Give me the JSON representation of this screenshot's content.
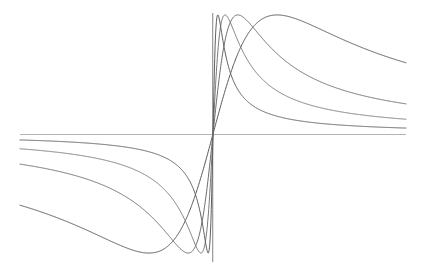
{
  "figure": {
    "title": "",
    "background_color": "#ffffff",
    "width": 423,
    "height": 274
  },
  "axes": {
    "origin_px": {
      "x": 213,
      "y": 134
    },
    "x_axis": {
      "name": "horizontal-axis",
      "color": "#b4b4b4",
      "stroke_width": 1.0,
      "x_start_px": 20,
      "x_end_px": 406,
      "y_px": 134
    },
    "y_axis": {
      "name": "vertical-axis",
      "color": "#8c8c8c",
      "stroke_width": 1.1,
      "y_start_px": 13,
      "y_end_px": 262,
      "x_px": 213
    }
  },
  "chart_data": {
    "type": "line",
    "title": "",
    "subtitle": "",
    "xlabel": "",
    "ylabel": "",
    "xlim": [
      -4.82,
      4.82
    ],
    "ylim": [
      -1.0,
      1.0
    ],
    "grid": false,
    "legend": "none",
    "symmetry": "odd (point symmetric about origin)",
    "function_family": "y = 2*a*x / (a^2 + x^2)",
    "x": [
      -4.8,
      -4.4,
      -4.0,
      -3.6,
      -3.2,
      -2.8,
      -2.4,
      -2.0,
      -1.6,
      -1.2,
      -0.8,
      -0.4,
      0.0,
      0.4,
      0.8,
      1.2,
      1.6,
      2.0,
      2.4,
      2.8,
      3.2,
      3.6,
      4.0,
      4.4,
      4.8
    ],
    "series": [
      {
        "name": "a = 1.60",
        "color": "#555555",
        "stroke_width": 1.0,
        "peak_xy": [
          1.6,
          1.0
        ],
        "trough_xy": [
          -1.6,
          -1.0
        ],
        "values": [
          -0.645,
          -0.69,
          -0.744,
          -0.806,
          -0.879,
          -0.963,
          -1.055,
          -1.139,
          -1.171,
          -1.071,
          -0.8,
          -0.427,
          0.0,
          0.427,
          0.8,
          1.071,
          1.171,
          1.139,
          1.055,
          0.963,
          0.879,
          0.806,
          0.744,
          0.69,
          0.645
        ]
      },
      {
        "name": "a = 0.62",
        "color": "#6b6b6b",
        "stroke_width": 1.0,
        "peak_xy": [
          0.62,
          0.72
        ],
        "trough_xy": [
          -0.62,
          -0.72
        ],
        "values": [
          -0.256,
          -0.279,
          -0.307,
          -0.341,
          -0.383,
          -0.437,
          -0.508,
          -0.601,
          -0.724,
          -0.876,
          -1.0,
          -0.93,
          0.0,
          0.93,
          1.0,
          0.876,
          0.724,
          0.601,
          0.508,
          0.437,
          0.383,
          0.341,
          0.307,
          0.279,
          0.256
        ]
      },
      {
        "name": "a = 0.30",
        "color": "#7a7a7a",
        "stroke_width": 1.0,
        "peak_xy": [
          0.3,
          0.47
        ],
        "trough_xy": [
          -0.3,
          -0.47
        ],
        "values": [
          -0.125,
          -0.136,
          -0.15,
          -0.167,
          -0.187,
          -0.214,
          -0.249,
          -0.296,
          -0.361,
          -0.451,
          -0.566,
          -0.68,
          0.0,
          0.68,
          0.566,
          0.451,
          0.361,
          0.296,
          0.249,
          0.214,
          0.187,
          0.167,
          0.15,
          0.136,
          0.125
        ]
      },
      {
        "name": "a = 0.12",
        "color": "#5f5f5f",
        "stroke_width": 1.0,
        "peak_xy": [
          0.12,
          0.2
        ],
        "trough_xy": [
          -0.12,
          -0.2
        ],
        "values": [
          -0.05,
          -0.055,
          -0.06,
          -0.067,
          -0.075,
          -0.086,
          -0.1,
          -0.12,
          -0.15,
          -0.199,
          -0.296,
          -0.54,
          0.0,
          0.54,
          0.296,
          0.199,
          0.15,
          0.12,
          0.1,
          0.086,
          0.075,
          0.067,
          0.06,
          0.055,
          0.05
        ]
      }
    ]
  },
  "curve_paths": {
    "curve_flattest": "M 28.4,146.6 C 60,144.2 96,141.6 124,137.6 C 152,133.4 176,126.6 196,118.2 C 204,114.8 209,113.4 213,113.2 C 219,113.1 228,114.7 241,117.3 C 262,121.3 290,125.6 322,128.8 C 350,131.6 380,133.3 405.5,134.0",
    "curve_flattest_mirror": "M 397.6,121.4 C 366,123.8 330,126.4 302,130.4 C 274,134.6 250,141.4 230,149.8 C 222,153.2 217,154.6 213,154.8 C 207,154.9 198,153.3 185,150.7 C 164,146.7 136,142.4 104,139.2 C 76,136.4 46,134.7 20.5,134.0",
    "curve_mid1": "M 28.4,146.6 C 62,144.0 100,141.0 132,137.0 C 160,133.4 182,128.0 196,120.0 C 203,115.6 208,112.0 213,111.8 C 218,111.6 223,115.2 228,122.0 C 234,130.4 238,142.0 243,155.0 C 250,173.0 256,190.0 262,199.0 C 268,207.0 274,205.0 282,195.0 C 296,177.0 312,156.0 330,146.0 C 350,135.0 378,131.0 405.5,130.0",
    "curve_steep": "M 20.5,141.0 C 50,140.4 88,139.0 120,137.4 C 150,135.8 176,132.0 192,125.0 C 202,120.6 208,112.0 213,111.8 C 218,111.6 222,118.0 226,128.0 C 230,138.0 233,151.0 236,163.0 C 240,180.0 244,196.0 249,204.0 C 254,212.0 260,208.0 268,196.0 C 282,175.0 300,150.0 322,140.0 C 346,129.0 380,126.0 405.5,125.0"
  },
  "icons": {},
  "labels": []
}
